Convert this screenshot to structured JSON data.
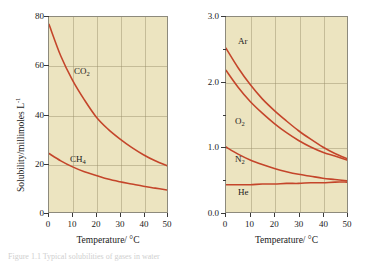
{
  "figure": {
    "caption": "Figure 1.1 Typical solubilities of gases in water"
  },
  "chart_data": [
    {
      "type": "line",
      "title": "",
      "xlabel": "Temperature/ °C",
      "ylabel": "Solubility/millimoles L",
      "ylabel_sup": "-1",
      "xlim": [
        0,
        50
      ],
      "ylim": [
        0,
        80
      ],
      "grid": true,
      "legend": "inline-labels",
      "xticks": [
        0,
        10,
        20,
        30,
        40,
        50
      ],
      "xtick_labels": [
        "0",
        "10",
        "20",
        "30",
        "40",
        "50"
      ],
      "yticks": [
        0,
        20,
        40,
        60,
        80
      ],
      "ytick_labels": [
        "0",
        "20",
        "40",
        "60",
        "80"
      ],
      "x": [
        0,
        5,
        10,
        15,
        20,
        25,
        30,
        35,
        40,
        45,
        50
      ],
      "series": [
        {
          "name": "CO2",
          "label": "CO",
          "label_sub": "2",
          "color": "#c4452a",
          "values": [
            77,
            64,
            54,
            46,
            39,
            34,
            30,
            26.5,
            23.5,
            21,
            19
          ]
        },
        {
          "name": "CH4",
          "label": "CH",
          "label_sub": "4",
          "color": "#c4452a",
          "values": [
            24,
            21,
            18.5,
            16.5,
            15,
            13.5,
            12.4,
            11.5,
            10.6,
            9.8,
            9
          ]
        }
      ]
    },
    {
      "type": "line",
      "title": "",
      "xlabel": "Temperature/ °C",
      "ylabel": "",
      "xlim": [
        0,
        50
      ],
      "ylim": [
        0.0,
        3.0
      ],
      "grid": true,
      "legend": "inline-labels",
      "xticks": [
        0,
        10,
        20,
        30,
        40,
        50
      ],
      "xtick_labels": [
        "0",
        "10",
        "20",
        "30",
        "40",
        "50"
      ],
      "yticks": [
        0.0,
        1.0,
        2.0,
        3.0
      ],
      "ytick_labels": [
        "0.0",
        "1.0",
        "2.0",
        "3.0"
      ],
      "yminorticks": [
        0.5,
        1.5,
        2.5
      ],
      "x": [
        0,
        5,
        10,
        15,
        20,
        25,
        30,
        35,
        40,
        45,
        50
      ],
      "series": [
        {
          "name": "Ar",
          "label": "Ar",
          "label_sub": "",
          "color": "#c4452a",
          "values": [
            2.52,
            2.22,
            1.96,
            1.74,
            1.56,
            1.4,
            1.25,
            1.12,
            1.0,
            0.9,
            0.82
          ]
        },
        {
          "name": "O2",
          "label": "O",
          "label_sub": "2",
          "color": "#c4452a",
          "values": [
            2.18,
            1.92,
            1.7,
            1.52,
            1.36,
            1.22,
            1.1,
            1.0,
            0.92,
            0.86,
            0.8
          ]
        },
        {
          "name": "N2",
          "label": "N",
          "label_sub": "2",
          "color": "#c4452a",
          "values": [
            1.0,
            0.89,
            0.8,
            0.73,
            0.67,
            0.62,
            0.58,
            0.55,
            0.52,
            0.5,
            0.48
          ]
        },
        {
          "name": "He",
          "label": "He",
          "label_sub": "",
          "color": "#c4452a",
          "values": [
            0.42,
            0.42,
            0.42,
            0.43,
            0.43,
            0.44,
            0.44,
            0.45,
            0.45,
            0.46,
            0.46
          ]
        }
      ]
    }
  ]
}
